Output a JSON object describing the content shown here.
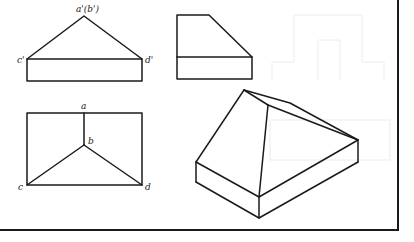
{
  "figure": {
    "front_view": {
      "labels": {
        "apex": "a'(b')",
        "left": "c'",
        "right": "d'"
      }
    },
    "side_view": {},
    "top_view": {
      "labels": {
        "a": "a",
        "b": "b",
        "c": "c",
        "d": "d"
      }
    },
    "isometric_view": {},
    "colors": {
      "line": "#1a1a1a",
      "background": "#ffffff"
    }
  }
}
